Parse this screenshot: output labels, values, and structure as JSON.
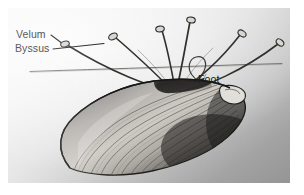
{
  "figure": {
    "kind": "scientific-illustration",
    "caption": "",
    "background_color": "#ffffff",
    "plate_gradient_light": "#f4f4f4",
    "plate_gradient_dark": "#949494",
    "ink_color": "#1d1d1d"
  },
  "labels": {
    "velum": "Velum",
    "byssus": "Byssus",
    "foot": "Foot"
  },
  "annotations": [
    {
      "id": "velum",
      "text": "Velum",
      "leader": "line from text to small oval plaque at upper-left thread tip"
    },
    {
      "id": "byssus",
      "text": "Byssus",
      "leader": "line from text to byssal thread bundle"
    },
    {
      "id": "foot",
      "text": "Foot",
      "leader": "line from text to curled foot above shell hinge"
    }
  ],
  "structures": {
    "substrate_line": "horizontal surface line across the plate",
    "attachment_point": "convergence of byssal threads at shell anterior",
    "thread_count": 6,
    "shell": "elongate mytilid valve, dark posterior margin, fine concentric growth lines"
  }
}
